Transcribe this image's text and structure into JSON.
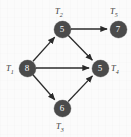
{
  "diagram": {
    "type": "directed-acyclic-graph",
    "title": "",
    "node_fill_color": "#4b4b4b",
    "node_text_color": "#ffffff",
    "edge_color": "#2b2b2b",
    "label_color": "#3a3a3a",
    "background_color": "#fbfbfb",
    "nodes": [
      {
        "id": "n8",
        "value": "8",
        "label_main": "T",
        "label_sub": "1",
        "label_text": "T1",
        "cx": 27,
        "cy": 68,
        "r": 8.5,
        "label_x": 6,
        "label_y": 64
      },
      {
        "id": "n5a",
        "value": "5",
        "label_main": "T",
        "label_sub": "2",
        "label_text": "T2",
        "cx": 62,
        "cy": 29,
        "r": 8.5,
        "label_x": 55,
        "label_y": 7
      },
      {
        "id": "n6",
        "value": "6",
        "label_main": "T",
        "label_sub": "3",
        "label_text": "T3",
        "cx": 62,
        "cy": 108,
        "r": 8.5,
        "label_x": 56,
        "label_y": 122
      },
      {
        "id": "n5b",
        "value": "5",
        "label_main": "T",
        "label_sub": "4",
        "label_text": "T4",
        "cx": 100,
        "cy": 68,
        "r": 8.5,
        "label_x": 111,
        "label_y": 64
      },
      {
        "id": "n7",
        "value": "7",
        "label_main": "T",
        "label_sub": "5",
        "label_text": "T5",
        "cx": 118,
        "cy": 29,
        "r": 8.5,
        "label_x": 110,
        "label_y": 7
      }
    ],
    "edges": [
      {
        "from": "n8",
        "to": "n5a",
        "name": "edge-t1-to-t2"
      },
      {
        "from": "n8",
        "to": "n5b",
        "name": "edge-t1-to-t4"
      },
      {
        "from": "n8",
        "to": "n6",
        "name": "edge-t1-to-t3"
      },
      {
        "from": "n5a",
        "to": "n7",
        "name": "edge-t2-to-t5"
      },
      {
        "from": "n5a",
        "to": "n5b",
        "name": "edge-t2-to-t4"
      },
      {
        "from": "n6",
        "to": "n5b",
        "name": "edge-t3-to-t4"
      }
    ]
  }
}
